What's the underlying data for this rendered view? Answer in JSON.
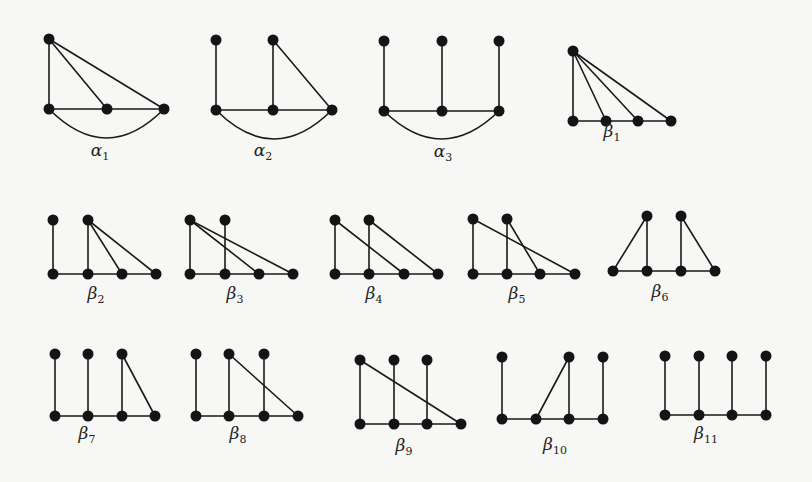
{
  "figure": {
    "ink_color": "#141414",
    "background_color": "#f7f7f5",
    "node_radius": 5.5,
    "graphs": [
      {
        "id": "alpha1",
        "greek": "α",
        "sub": "1",
        "label_pos": [
          100,
          156
        ],
        "nodes": [
          [
            49,
            39
          ],
          [
            49,
            109
          ],
          [
            107,
            109
          ],
          [
            164,
            109
          ]
        ],
        "edges": [
          [
            0,
            1
          ],
          [
            0,
            2
          ],
          [
            0,
            3
          ],
          [
            1,
            2
          ],
          [
            2,
            3
          ]
        ],
        "arcs": [
          {
            "from": 1,
            "to": 3,
            "depth": 58
          }
        ]
      },
      {
        "id": "alpha2",
        "greek": "α",
        "sub": "2",
        "label_pos": [
          263,
          156
        ],
        "nodes": [
          [
            216,
            40
          ],
          [
            273,
            40
          ],
          [
            216,
            110
          ],
          [
            273,
            110
          ],
          [
            332,
            110
          ]
        ],
        "edges": [
          [
            0,
            2
          ],
          [
            1,
            3
          ],
          [
            1,
            4
          ],
          [
            2,
            3
          ],
          [
            3,
            4
          ]
        ],
        "arcs": [
          {
            "from": 2,
            "to": 4,
            "depth": 58
          }
        ]
      },
      {
        "id": "alpha3",
        "greek": "α",
        "sub": "3",
        "label_pos": [
          443,
          157
        ],
        "nodes": [
          [
            384,
            41
          ],
          [
            442,
            41
          ],
          [
            499,
            41
          ],
          [
            384,
            111
          ],
          [
            442,
            111
          ],
          [
            499,
            111
          ]
        ],
        "edges": [
          [
            0,
            3
          ],
          [
            1,
            4
          ],
          [
            2,
            5
          ],
          [
            3,
            4
          ],
          [
            4,
            5
          ]
        ],
        "arcs": [
          {
            "from": 3,
            "to": 5,
            "depth": 56
          }
        ]
      },
      {
        "id": "beta1",
        "greek": "β",
        "sub": "1",
        "label_pos": [
          612,
          137
        ],
        "nodes": [
          [
            573,
            51
          ],
          [
            573,
            121
          ],
          [
            606,
            121
          ],
          [
            638,
            121
          ],
          [
            671,
            121
          ]
        ],
        "edges": [
          [
            0,
            1
          ],
          [
            0,
            2
          ],
          [
            0,
            3
          ],
          [
            0,
            4
          ],
          [
            1,
            2
          ],
          [
            2,
            3
          ],
          [
            3,
            4
          ]
        ],
        "arcs": []
      },
      {
        "id": "beta2",
        "greek": "β",
        "sub": "2",
        "label_pos": [
          96,
          299
        ],
        "nodes": [
          [
            53,
            220
          ],
          [
            88,
            220
          ],
          [
            53,
            274
          ],
          [
            88,
            274
          ],
          [
            122,
            274
          ],
          [
            156,
            274
          ]
        ],
        "edges": [
          [
            0,
            2
          ],
          [
            1,
            3
          ],
          [
            1,
            4
          ],
          [
            1,
            5
          ],
          [
            2,
            3
          ],
          [
            3,
            4
          ],
          [
            4,
            5
          ]
        ],
        "arcs": []
      },
      {
        "id": "beta3",
        "greek": "β",
        "sub": "3",
        "label_pos": [
          235,
          299
        ],
        "nodes": [
          [
            190,
            220
          ],
          [
            225,
            220
          ],
          [
            190,
            274
          ],
          [
            225,
            274
          ],
          [
            259,
            274
          ],
          [
            293,
            274
          ]
        ],
        "edges": [
          [
            0,
            2
          ],
          [
            1,
            3
          ],
          [
            0,
            4
          ],
          [
            0,
            5
          ],
          [
            2,
            3
          ],
          [
            3,
            4
          ],
          [
            4,
            5
          ]
        ],
        "arcs": []
      },
      {
        "id": "beta4",
        "greek": "β",
        "sub": "4",
        "label_pos": [
          374,
          299
        ],
        "nodes": [
          [
            335,
            220
          ],
          [
            369,
            220
          ],
          [
            335,
            274
          ],
          [
            369,
            274
          ],
          [
            404,
            274
          ],
          [
            438,
            274
          ]
        ],
        "edges": [
          [
            0,
            2
          ],
          [
            1,
            3
          ],
          [
            0,
            4
          ],
          [
            1,
            5
          ],
          [
            2,
            3
          ],
          [
            3,
            4
          ],
          [
            4,
            5
          ]
        ],
        "arcs": []
      },
      {
        "id": "beta5",
        "greek": "β",
        "sub": "5",
        "label_pos": [
          517,
          299
        ],
        "nodes": [
          [
            473,
            219
          ],
          [
            507,
            219
          ],
          [
            473,
            274
          ],
          [
            507,
            274
          ],
          [
            540,
            274
          ],
          [
            575,
            274
          ]
        ],
        "edges": [
          [
            0,
            2
          ],
          [
            1,
            3
          ],
          [
            1,
            4
          ],
          [
            0,
            5
          ],
          [
            2,
            3
          ],
          [
            3,
            4
          ],
          [
            4,
            5
          ]
        ],
        "arcs": []
      },
      {
        "id": "beta6",
        "greek": "β",
        "sub": "6",
        "label_pos": [
          660,
          297
        ],
        "nodes": [
          [
            647,
            216
          ],
          [
            681,
            216
          ],
          [
            613,
            271
          ],
          [
            647,
            271
          ],
          [
            681,
            271
          ],
          [
            715,
            271
          ]
        ],
        "edges": [
          [
            0,
            2
          ],
          [
            0,
            3
          ],
          [
            1,
            4
          ],
          [
            1,
            5
          ],
          [
            2,
            3
          ],
          [
            3,
            4
          ],
          [
            4,
            5
          ]
        ],
        "arcs": []
      },
      {
        "id": "beta7",
        "greek": "β",
        "sub": "7",
        "label_pos": [
          87,
          439
        ],
        "nodes": [
          [
            55,
            354
          ],
          [
            88,
            354
          ],
          [
            122,
            354
          ],
          [
            55,
            416
          ],
          [
            88,
            416
          ],
          [
            122,
            416
          ],
          [
            155,
            416
          ]
        ],
        "edges": [
          [
            0,
            3
          ],
          [
            1,
            4
          ],
          [
            2,
            5
          ],
          [
            2,
            6
          ],
          [
            3,
            4
          ],
          [
            4,
            5
          ],
          [
            5,
            6
          ]
        ],
        "arcs": []
      },
      {
        "id": "beta8",
        "greek": "β",
        "sub": "8",
        "label_pos": [
          238,
          439
        ],
        "nodes": [
          [
            196,
            354
          ],
          [
            229,
            354
          ],
          [
            264,
            354
          ],
          [
            196,
            416
          ],
          [
            229,
            416
          ],
          [
            264,
            416
          ],
          [
            298,
            416
          ]
        ],
        "edges": [
          [
            0,
            3
          ],
          [
            1,
            4
          ],
          [
            2,
            5
          ],
          [
            1,
            6
          ],
          [
            3,
            4
          ],
          [
            4,
            5
          ],
          [
            5,
            6
          ]
        ],
        "arcs": []
      },
      {
        "id": "beta9",
        "greek": "β",
        "sub": "9",
        "label_pos": [
          404,
          451
        ],
        "nodes": [
          [
            360,
            360
          ],
          [
            394,
            360
          ],
          [
            427,
            360
          ],
          [
            360,
            424
          ],
          [
            394,
            424
          ],
          [
            427,
            424
          ],
          [
            461,
            424
          ]
        ],
        "edges": [
          [
            0,
            3
          ],
          [
            1,
            4
          ],
          [
            2,
            5
          ],
          [
            0,
            6
          ],
          [
            3,
            4
          ],
          [
            4,
            5
          ],
          [
            5,
            6
          ]
        ],
        "arcs": []
      },
      {
        "id": "beta10",
        "greek": "β",
        "sub": "10",
        "label_pos": [
          555,
          450
        ],
        "nodes": [
          [
            502,
            357
          ],
          [
            569,
            357
          ],
          [
            603,
            357
          ],
          [
            502,
            419
          ],
          [
            536,
            419
          ],
          [
            569,
            419
          ],
          [
            603,
            419
          ]
        ],
        "edges": [
          [
            0,
            3
          ],
          [
            1,
            4
          ],
          [
            1,
            5
          ],
          [
            2,
            6
          ],
          [
            3,
            4
          ],
          [
            4,
            5
          ],
          [
            5,
            6
          ]
        ],
        "arcs": []
      },
      {
        "id": "beta11",
        "greek": "β",
        "sub": "11",
        "label_pos": [
          706,
          439
        ],
        "nodes": [
          [
            665,
            356
          ],
          [
            699,
            356
          ],
          [
            732,
            356
          ],
          [
            766,
            356
          ],
          [
            665,
            415
          ],
          [
            699,
            415
          ],
          [
            732,
            415
          ],
          [
            766,
            415
          ]
        ],
        "edges": [
          [
            0,
            4
          ],
          [
            1,
            5
          ],
          [
            2,
            6
          ],
          [
            3,
            7
          ],
          [
            4,
            5
          ],
          [
            5,
            6
          ],
          [
            6,
            7
          ]
        ],
        "arcs": []
      }
    ]
  }
}
